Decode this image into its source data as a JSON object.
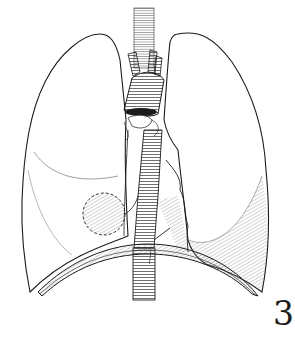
{
  "figure": {
    "number": "3",
    "parts": [
      {
        "id": "right-lung",
        "label": "right lung (viewer's left)"
      },
      {
        "id": "left-lung",
        "label": "left lung (viewer's right)"
      },
      {
        "id": "trachea",
        "label": "trachea"
      },
      {
        "id": "aortic-arch",
        "label": "aortic arch with branches"
      },
      {
        "id": "esophagus",
        "label": "esophagus"
      },
      {
        "id": "diaphragm",
        "label": "diaphragm"
      },
      {
        "id": "mass",
        "label": "spherical mass / lymph node"
      }
    ]
  },
  "colors": {
    "background": "#ffffff",
    "ink": "#1c1c1c",
    "hatch": "#555555"
  }
}
